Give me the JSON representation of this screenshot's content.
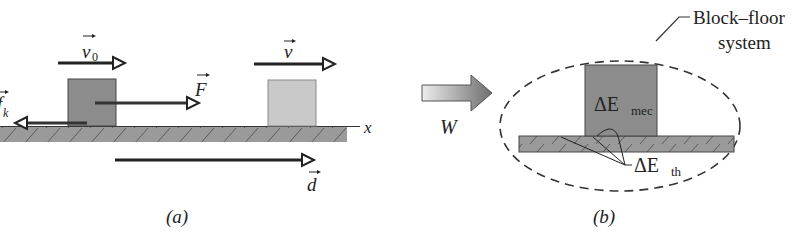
{
  "figure": {
    "panel_a": {
      "caption": "(a)",
      "initial_velocity_label": "v",
      "initial_velocity_subscript": "0",
      "final_velocity_label": "v",
      "applied_force_label": "F",
      "friction_label": "f",
      "friction_subscript": "k",
      "displacement_label": "d",
      "axis_label": "x"
    },
    "panel_b": {
      "caption": "(b)",
      "work_label": "W",
      "system_label_line1": "Block–floor",
      "system_label_line2": "system",
      "mech_energy_prefix": "ΔE",
      "mech_energy_subscript": "mec",
      "thermal_energy_prefix": "ΔE",
      "thermal_energy_subscript": "th"
    },
    "colors": {
      "block_initial": "#8c8c8c",
      "block_final": "#c8c8c8",
      "floor": "#9a9a9a",
      "arrow": "#222222",
      "work_arrow_start": "#e6e6e6",
      "work_arrow_end": "#6e6e6e"
    }
  }
}
